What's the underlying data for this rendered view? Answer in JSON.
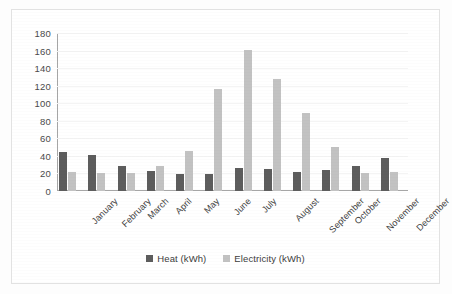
{
  "chart_data": {
    "type": "bar",
    "title": "",
    "xlabel": "",
    "ylabel": "",
    "ylim": [
      0,
      180
    ],
    "ytick_step": 20,
    "yticks": [
      180,
      160,
      140,
      120,
      100,
      80,
      60,
      40,
      20,
      0
    ],
    "grid": true,
    "legend_position": "bottom",
    "categories": [
      "January",
      "February",
      "March",
      "April",
      "May",
      "June",
      "July",
      "August",
      "September",
      "October",
      "November",
      "December"
    ],
    "series": [
      {
        "name": "Heat (kWh)",
        "color": "#5d5d5d",
        "values": [
          44,
          41,
          28,
          23,
          19,
          19,
          26,
          25,
          22,
          24,
          29,
          38
        ]
      },
      {
        "name": "Electricity (kWh)",
        "color": "#c2c2c2",
        "values": [
          22,
          21,
          20,
          29,
          46,
          116,
          161,
          128,
          89,
          50,
          20,
          22
        ]
      }
    ]
  }
}
